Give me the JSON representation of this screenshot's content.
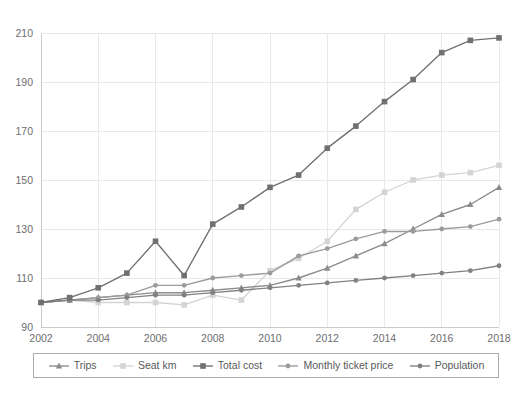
{
  "chart_data": {
    "type": "line",
    "title": "",
    "subtitle": "",
    "xlabel": "",
    "ylabel": "",
    "x": [
      2002,
      2003,
      2004,
      2005,
      2006,
      2007,
      2008,
      2009,
      2010,
      2011,
      2012,
      2013,
      2014,
      2015,
      2016,
      2017,
      2018
    ],
    "xtick_labels": [
      "2002",
      "2004",
      "2006",
      "2008",
      "2010",
      "2012",
      "2014",
      "2016",
      "2018"
    ],
    "xtick_values": [
      2002,
      2004,
      2006,
      2008,
      2010,
      2012,
      2014,
      2016,
      2018
    ],
    "ytick_labels": [
      "90",
      "110",
      "130",
      "150",
      "170",
      "190",
      "210"
    ],
    "ytick_values": [
      90,
      110,
      130,
      150,
      170,
      190,
      210
    ],
    "xlim": [
      2002,
      2018
    ],
    "ylim": [
      90,
      210
    ],
    "grid": true,
    "legend_position": "bottom",
    "series": [
      {
        "name": "Trips",
        "marker": "triangle",
        "color": "#8a8b8d",
        "values": [
          100,
          101,
          102,
          103,
          104,
          104,
          105,
          106,
          107,
          110,
          114,
          119,
          124,
          130,
          136,
          140,
          147
        ]
      },
      {
        "name": "Seat km",
        "marker": "square",
        "color": "#d3d4d5",
        "values": [
          100,
          101,
          100,
          100,
          100,
          99,
          103,
          101,
          113,
          118,
          125,
          138,
          145,
          150,
          152,
          153,
          156
        ]
      },
      {
        "name": "Total cost",
        "marker": "square",
        "color": "#6f7072",
        "values": [
          100,
          102,
          106,
          112,
          125,
          111,
          132,
          139,
          147,
          152,
          163,
          172,
          182,
          191,
          202,
          207,
          208
        ]
      },
      {
        "name": "Monthly ticket price",
        "marker": "circle",
        "color": "#9a9b9d",
        "values": [
          100,
          101,
          102,
          103,
          107,
          107,
          110,
          111,
          112,
          119,
          122,
          126,
          129,
          129,
          130,
          131,
          134
        ]
      },
      {
        "name": "Population",
        "marker": "circle",
        "color": "#808183",
        "values": [
          100,
          101,
          101,
          102,
          103,
          103,
          104,
          105,
          106,
          107,
          108,
          109,
          110,
          111,
          112,
          113,
          115
        ]
      }
    ]
  }
}
